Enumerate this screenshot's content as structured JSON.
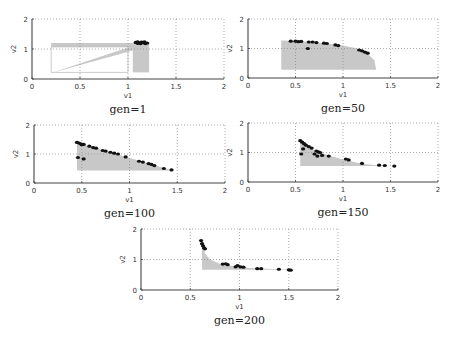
{
  "chart_data": [
    {
      "type": "scatter",
      "caption": "gen=1",
      "xlabel": "v1",
      "ylabel": "v2",
      "xlim": [
        0,
        2
      ],
      "ylim": [
        0,
        2
      ],
      "xticks": [
        "0",
        "0.5",
        "1",
        "1.5",
        "2"
      ],
      "yticks": [
        "0",
        "1",
        "2"
      ],
      "grid": true,
      "box": {
        "left": 32,
        "top": 19,
        "right": 224,
        "bottom": 79
      },
      "shaded_regions": [
        [
          [
            0.2,
            1.2
          ],
          [
            1.05,
            1.2
          ],
          [
            1.05,
            1.07
          ],
          [
            0.2,
            1.07
          ]
        ],
        [
          [
            0.2,
            0.2
          ],
          [
            1.05,
            1.1
          ],
          [
            1.05,
            0.95
          ]
        ],
        [
          [
            1.05,
            1.2
          ],
          [
            1.22,
            1.2
          ],
          [
            1.22,
            0.22
          ],
          [
            1.05,
            0.22
          ]
        ]
      ],
      "outline": [
        [
          0.2,
          0.22
        ],
        [
          1.0,
          0.22
        ],
        [
          1.0,
          1.07
        ],
        [
          0.2,
          1.07
        ]
      ],
      "points": [
        [
          1.08,
          1.22
        ],
        [
          1.1,
          1.24
        ],
        [
          1.12,
          1.2
        ],
        [
          1.14,
          1.23
        ],
        [
          1.16,
          1.21
        ],
        [
          1.18,
          1.18
        ],
        [
          1.2,
          1.2
        ],
        [
          1.13,
          1.18
        ],
        [
          1.1,
          1.19
        ],
        [
          1.17,
          1.24
        ]
      ]
    },
    {
      "type": "scatter",
      "caption": "gen=50",
      "xlabel": "v1",
      "ylabel": "v2",
      "xlim": [
        0,
        2
      ],
      "ylim": [
        0,
        2
      ],
      "xticks": [
        "0",
        "0.5",
        "1",
        "1.5",
        "2"
      ],
      "yticks": [
        "0",
        "1",
        "2"
      ],
      "grid": true,
      "box": {
        "left": 248,
        "top": 19,
        "right": 438,
        "bottom": 78
      },
      "shaded_regions": [
        [
          [
            0.35,
            1.27
          ],
          [
            0.5,
            1.26
          ],
          [
            0.8,
            1.18
          ],
          [
            1.0,
            1.1
          ],
          [
            1.15,
            1.0
          ],
          [
            1.25,
            0.85
          ],
          [
            1.33,
            0.6
          ],
          [
            1.35,
            0.28
          ],
          [
            0.35,
            0.28
          ]
        ]
      ],
      "points": [
        [
          0.45,
          1.25
        ],
        [
          0.5,
          1.25
        ],
        [
          0.53,
          1.23
        ],
        [
          0.56,
          1.24
        ],
        [
          0.63,
          1.0
        ],
        [
          0.64,
          1.22
        ],
        [
          0.68,
          1.22
        ],
        [
          0.72,
          1.2
        ],
        [
          0.8,
          1.18
        ],
        [
          0.83,
          1.17
        ],
        [
          0.92,
          1.12
        ],
        [
          0.95,
          1.1
        ],
        [
          1.17,
          0.95
        ],
        [
          1.2,
          0.92
        ],
        [
          1.23,
          0.88
        ],
        [
          1.26,
          0.84
        ]
      ]
    },
    {
      "type": "scatter",
      "caption": "gen=100",
      "xlabel": "v1",
      "ylabel": "v2",
      "xlim": [
        0,
        2
      ],
      "ylim": [
        0,
        2
      ],
      "xticks": [
        "0",
        "0.5",
        "1",
        "1.5",
        "2"
      ],
      "yticks": [
        "0",
        "1",
        "2"
      ],
      "grid": true,
      "box": {
        "left": 34,
        "top": 125,
        "right": 225,
        "bottom": 183
      },
      "shaded_regions": [
        [
          [
            0.45,
            1.4
          ],
          [
            1.45,
            0.43
          ],
          [
            0.45,
            0.43
          ]
        ]
      ],
      "points": [
        [
          0.45,
          1.4
        ],
        [
          0.47,
          1.38
        ],
        [
          0.49,
          1.35
        ],
        [
          0.5,
          1.32
        ],
        [
          0.52,
          1.33
        ],
        [
          0.46,
          0.88
        ],
        [
          0.52,
          0.83
        ],
        [
          0.58,
          1.27
        ],
        [
          0.62,
          1.22
        ],
        [
          0.65,
          1.2
        ],
        [
          0.72,
          1.12
        ],
        [
          0.75,
          1.1
        ],
        [
          0.8,
          1.06
        ],
        [
          0.84,
          1.03
        ],
        [
          0.88,
          1.0
        ],
        [
          0.96,
          0.9
        ],
        [
          1.1,
          0.75
        ],
        [
          1.14,
          0.72
        ],
        [
          1.2,
          0.67
        ],
        [
          1.23,
          0.64
        ],
        [
          1.26,
          0.6
        ],
        [
          1.36,
          0.5
        ],
        [
          1.44,
          0.45
        ]
      ]
    },
    {
      "type": "scatter",
      "caption": "gen=150",
      "xlabel": "v1",
      "ylabel": "v2",
      "xlim": [
        0,
        2
      ],
      "ylim": [
        0,
        2
      ],
      "xticks": [
        "0",
        "0.5",
        "1",
        "1.5",
        "2"
      ],
      "yticks": [
        "0",
        "1",
        "2"
      ],
      "grid": true,
      "box": {
        "left": 248,
        "top": 123,
        "right": 438,
        "bottom": 182
      },
      "shaded_regions": [
        [
          [
            0.55,
            1.4
          ],
          [
            0.6,
            1.25
          ],
          [
            0.7,
            1.08
          ],
          [
            0.85,
            0.9
          ],
          [
            1.0,
            0.76
          ],
          [
            1.2,
            0.62
          ],
          [
            1.4,
            0.55
          ],
          [
            1.55,
            0.54
          ],
          [
            0.55,
            0.54
          ]
        ]
      ],
      "points": [
        [
          0.55,
          1.4
        ],
        [
          0.57,
          1.35
        ],
        [
          0.59,
          1.3
        ],
        [
          0.61,
          1.25
        ],
        [
          0.58,
          1.12
        ],
        [
          0.56,
          0.95
        ],
        [
          0.64,
          1.2
        ],
        [
          0.67,
          1.15
        ],
        [
          0.72,
          1.05
        ],
        [
          0.74,
          1.02
        ],
        [
          0.76,
          1.0
        ],
        [
          0.7,
          0.95
        ],
        [
          0.73,
          0.88
        ],
        [
          0.78,
          0.9
        ],
        [
          0.85,
          0.88
        ],
        [
          1.03,
          0.78
        ],
        [
          1.06,
          0.75
        ],
        [
          1.2,
          0.63
        ],
        [
          1.38,
          0.57
        ],
        [
          1.44,
          0.56
        ],
        [
          1.54,
          0.54
        ]
      ]
    },
    {
      "type": "scatter",
      "caption": "gen=200",
      "xlabel": "v1",
      "ylabel": "v2",
      "xlim": [
        0,
        2
      ],
      "ylim": [
        0,
        2
      ],
      "xticks": [
        "0",
        "0.5",
        "1",
        "1.5",
        "2"
      ],
      "yticks": [
        "0",
        "1",
        "2"
      ],
      "grid": true,
      "box": {
        "left": 141,
        "top": 229,
        "right": 338,
        "bottom": 290
      },
      "shaded_regions": [
        [
          [
            0.62,
            1.6
          ],
          [
            0.65,
            1.2
          ],
          [
            0.7,
            1.0
          ],
          [
            0.8,
            0.86
          ],
          [
            0.95,
            0.78
          ],
          [
            1.1,
            0.72
          ],
          [
            1.4,
            0.68
          ],
          [
            1.62,
            0.66
          ],
          [
            0.62,
            0.66
          ]
        ]
      ],
      "points": [
        [
          0.61,
          1.62
        ],
        [
          0.62,
          1.52
        ],
        [
          0.63,
          1.45
        ],
        [
          0.64,
          1.38
        ],
        [
          0.65,
          1.35
        ],
        [
          0.83,
          0.85
        ],
        [
          0.86,
          0.86
        ],
        [
          0.88,
          0.83
        ],
        [
          0.96,
          0.76
        ],
        [
          0.98,
          0.8
        ],
        [
          1.01,
          0.76
        ],
        [
          1.04,
          0.75
        ],
        [
          1.18,
          0.7
        ],
        [
          1.22,
          0.7
        ],
        [
          1.4,
          0.68
        ],
        [
          1.5,
          0.66
        ],
        [
          1.52,
          0.65
        ]
      ]
    }
  ]
}
